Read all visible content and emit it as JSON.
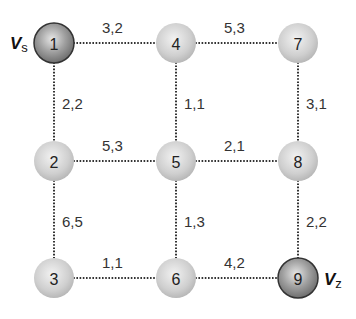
{
  "diagram": {
    "type": "grid-graph",
    "source_label": {
      "main": "V",
      "sub": "s",
      "node": "1"
    },
    "sink_label": {
      "main": "V",
      "sub": "z",
      "node": "9"
    },
    "nodes": [
      {
        "id": "1",
        "x": 54,
        "y": 43,
        "style": "dark"
      },
      {
        "id": "4",
        "x": 176,
        "y": 43,
        "style": "light"
      },
      {
        "id": "7",
        "x": 298,
        "y": 43,
        "style": "light"
      },
      {
        "id": "2",
        "x": 54,
        "y": 161,
        "style": "light"
      },
      {
        "id": "5",
        "x": 176,
        "y": 161,
        "style": "light"
      },
      {
        "id": "8",
        "x": 298,
        "y": 161,
        "style": "light"
      },
      {
        "id": "3",
        "x": 54,
        "y": 278,
        "style": "light"
      },
      {
        "id": "6",
        "x": 176,
        "y": 278,
        "style": "light"
      },
      {
        "id": "9",
        "x": 298,
        "y": 278,
        "style": "dark"
      }
    ],
    "edges": [
      {
        "from": "1",
        "to": "4",
        "label": "3,2",
        "lx": 102,
        "ly": 33
      },
      {
        "from": "4",
        "to": "7",
        "label": "5,3",
        "lx": 224,
        "ly": 33
      },
      {
        "from": "1",
        "to": "2",
        "label": "2,2",
        "lx": 62,
        "ly": 109
      },
      {
        "from": "4",
        "to": "5",
        "label": "1,1",
        "lx": 184,
        "ly": 109
      },
      {
        "from": "7",
        "to": "8",
        "label": "3,1",
        "lx": 306,
        "ly": 109
      },
      {
        "from": "2",
        "to": "5",
        "label": "5,3",
        "lx": 102,
        "ly": 151
      },
      {
        "from": "5",
        "to": "8",
        "label": "2,1",
        "lx": 224,
        "ly": 151
      },
      {
        "from": "2",
        "to": "3",
        "label": "6,5",
        "lx": 62,
        "ly": 227
      },
      {
        "from": "5",
        "to": "6",
        "label": "1,3",
        "lx": 184,
        "ly": 227
      },
      {
        "from": "8",
        "to": "9",
        "label": "2,2",
        "lx": 306,
        "ly": 227
      },
      {
        "from": "3",
        "to": "6",
        "label": "1,1",
        "lx": 102,
        "ly": 268
      },
      {
        "from": "6",
        "to": "9",
        "label": "4,2",
        "lx": 224,
        "ly": 268
      }
    ],
    "colors": {
      "light_node": "#c8c8c8",
      "dark_node": "#8a8a8a",
      "edge": "#333333"
    }
  }
}
